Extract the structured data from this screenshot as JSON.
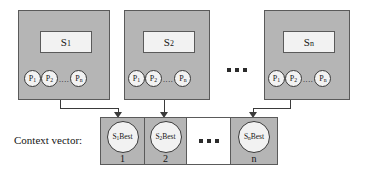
{
  "diagram": {
    "title_label": "Context vector:",
    "colors": {
      "swarm_fill": "#b5b5b5",
      "swarm_border": "#5a5a5a",
      "inner_fill": "#f2f2f2",
      "blank_cell_fill": "#ffffff",
      "stroke": "#3a3a3a",
      "background": "#ffffff"
    },
    "swarms": [
      {
        "name": "swarm-1",
        "label_main": "S",
        "label_sub": "1",
        "particles": [
          {
            "main": "P",
            "sub": "1"
          },
          {
            "main": "P",
            "sub": "2"
          },
          {
            "main": "P",
            "sub": "n"
          }
        ],
        "particle_ellipsis": "...."
      },
      {
        "name": "swarm-2",
        "label_main": "S",
        "label_sub": "2",
        "particles": [
          {
            "main": "P",
            "sub": "1"
          },
          {
            "main": "P",
            "sub": "2"
          },
          {
            "main": "P",
            "sub": "n"
          }
        ],
        "particle_ellipsis": "...."
      },
      {
        "name": "swarm-n",
        "label_main": "S",
        "label_sub": "n",
        "particles": [
          {
            "main": "P",
            "sub": "1"
          },
          {
            "main": "P",
            "sub": "2"
          },
          {
            "main": "P",
            "sub": "n"
          }
        ],
        "particle_ellipsis": "...."
      }
    ],
    "swarm_ellipsis": "...",
    "context_vector": {
      "cells": [
        {
          "name": "cell-1",
          "circle_prefix": "S",
          "circle_sub": "1",
          "circle_suffix": "Best",
          "index": "1",
          "blank": false
        },
        {
          "name": "cell-2",
          "circle_prefix": "S",
          "circle_sub": "2",
          "circle_suffix": "Best",
          "index": "2",
          "blank": false
        },
        {
          "name": "cell-ellipsis",
          "ellipsis": "...",
          "blank": true
        },
        {
          "name": "cell-n",
          "circle_prefix": "S",
          "circle_sub": "n",
          "circle_suffix": "Best",
          "index": "n",
          "blank": false
        }
      ]
    }
  }
}
